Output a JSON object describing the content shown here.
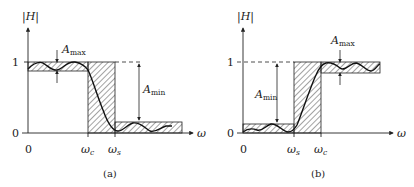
{
  "figure": {
    "panels": [
      {
        "id": "a",
        "caption": "(a)",
        "type": "lowpass",
        "y_axis_label": "|H|",
        "x_axis_label": "ω",
        "y_ticks": [
          "1",
          "0"
        ],
        "x_ticks": [
          "0",
          "ω",
          "ω"
        ],
        "x_tick_subs": [
          "",
          "c",
          "s"
        ],
        "annotations": {
          "amax": {
            "main": "A",
            "sub": "max"
          },
          "amin": {
            "main": "A",
            "sub": "min"
          }
        }
      },
      {
        "id": "b",
        "caption": "(b)",
        "type": "highpass",
        "y_axis_label": "|H|",
        "x_axis_label": "ω",
        "y_ticks": [
          "1",
          "0"
        ],
        "x_ticks": [
          "0",
          "ω",
          "ω"
        ],
        "x_tick_subs": [
          "",
          "s",
          "c"
        ],
        "annotations": {
          "amax": {
            "main": "A",
            "sub": "max"
          },
          "amin": {
            "main": "A",
            "sub": "min"
          }
        }
      }
    ],
    "colors": {
      "ink": "#222222",
      "background": "#ffffff"
    }
  }
}
